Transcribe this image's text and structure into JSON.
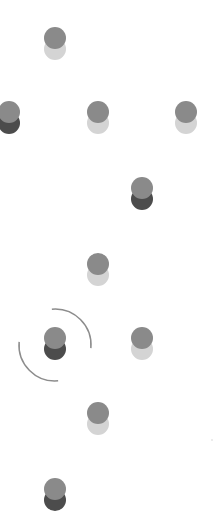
{
  "board": {
    "background": "#ffffff",
    "piece_top_color": "#8a8a8a",
    "light_base_color": "#d4d4d4",
    "dark_base_color": "#4c4c4c",
    "ring_color": "#8c8c8c"
  },
  "pieces": [
    {
      "id": "piece-1",
      "x": 55,
      "y": 38,
      "base": "light"
    },
    {
      "id": "piece-2",
      "x": 9,
      "y": 112,
      "base": "dark"
    },
    {
      "id": "piece-3",
      "x": 98,
      "y": 112,
      "base": "light"
    },
    {
      "id": "piece-4",
      "x": 186,
      "y": 112,
      "base": "light"
    },
    {
      "id": "piece-5",
      "x": 142,
      "y": 188,
      "base": "dark"
    },
    {
      "id": "piece-6",
      "x": 98,
      "y": 264,
      "base": "light"
    },
    {
      "id": "piece-7",
      "x": 55,
      "y": 338,
      "base": "dark",
      "selected": true
    },
    {
      "id": "piece-8",
      "x": 142,
      "y": 338,
      "base": "light"
    },
    {
      "id": "piece-9",
      "x": 98,
      "y": 413,
      "base": "light"
    },
    {
      "id": "piece-10",
      "x": 55,
      "y": 489,
      "base": "dark"
    }
  ],
  "selection": {
    "piece": "piece-7",
    "cx": 55,
    "cy": 345,
    "radius": 36
  },
  "speck": {
    "x": 211,
    "y": 439
  }
}
